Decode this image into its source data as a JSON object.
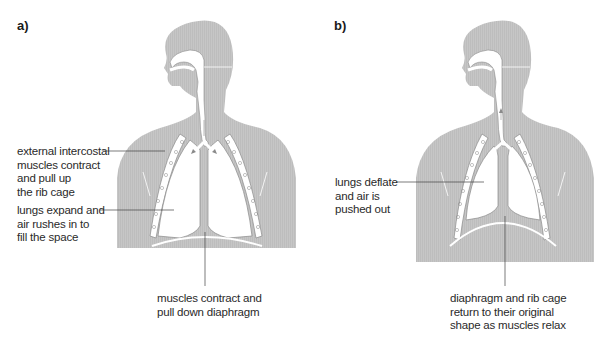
{
  "diagram": {
    "colors": {
      "body": "#c4c4c4",
      "lung": "#ffffff",
      "outline": "#8a8a8a",
      "leader_line": "#444444",
      "text": "#2a2a2a"
    },
    "panels": [
      {
        "id": "a",
        "label": "a)",
        "state": "inhalation",
        "annotations": [
          {
            "id": "intercostal",
            "lines": [
              "external intercostal",
              "muscles contract",
              "and pull up",
              "the rib cage"
            ],
            "target": "rib cage"
          },
          {
            "id": "lungs",
            "lines": [
              "lungs expand and",
              "air rushes in to",
              "fill the space"
            ],
            "target": "lung"
          },
          {
            "id": "diaphragm",
            "lines": [
              "muscles contract and",
              "pull down diaphragm"
            ],
            "target": "diaphragm"
          }
        ]
      },
      {
        "id": "b",
        "label": "b)",
        "state": "exhalation",
        "annotations": [
          {
            "id": "lungs",
            "lines": [
              "lungs deflate",
              "and air is",
              "pushed out"
            ],
            "target": "lung"
          },
          {
            "id": "diaphragm",
            "lines": [
              "diaphragm and rib cage",
              "return to their original",
              "shape as muscles relax"
            ],
            "target": "diaphragm"
          }
        ]
      }
    ]
  }
}
